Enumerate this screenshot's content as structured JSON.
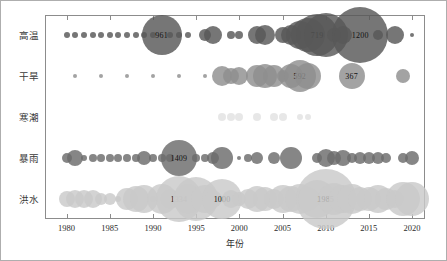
{
  "chart_data": {
    "type": "scatter",
    "title": "",
    "xlabel": "年份",
    "ylabel": "",
    "xlim": [
      1977.5,
      2021.5
    ],
    "xticks": [
      1980,
      1985,
      1990,
      1995,
      2000,
      2005,
      2010,
      2015,
      2020
    ],
    "xticklabels": [
      "1980",
      "1985",
      "1990",
      "1995",
      "2000",
      "2005",
      "2010",
      "2015",
      "2020"
    ],
    "grid": false,
    "legend": "none",
    "categories": [
      "高温",
      "干旱",
      "寒潮",
      "暴雨",
      "洪水"
    ],
    "series": [
      {
        "name": "高温",
        "color": "#585858",
        "points": [
          {
            "x": 1980,
            "size": 3
          },
          {
            "x": 1981,
            "size": 3
          },
          {
            "x": 1982,
            "size": 3
          },
          {
            "x": 1983,
            "size": 3
          },
          {
            "x": 1984,
            "size": 3
          },
          {
            "x": 1985,
            "size": 3
          },
          {
            "x": 1986,
            "size": 3
          },
          {
            "x": 1987,
            "size": 3
          },
          {
            "x": 1988,
            "size": 3
          },
          {
            "x": 1989,
            "size": 3
          },
          {
            "x": 1990,
            "size": 3
          },
          {
            "x": 1991,
            "size": 20,
            "label": "961"
          },
          {
            "x": 1992,
            "size": 3
          },
          {
            "x": 1993,
            "size": 3
          },
          {
            "x": 1994,
            "size": 3
          },
          {
            "x": 1996,
            "size": 6
          },
          {
            "x": 1997,
            "size": 9
          },
          {
            "x": 1999,
            "size": 4
          },
          {
            "x": 2000,
            "size": 4
          },
          {
            "x": 2002,
            "size": 9
          },
          {
            "x": 2003,
            "size": 10
          },
          {
            "x": 2005,
            "size": 8
          },
          {
            "x": 2006,
            "size": 10
          },
          {
            "x": 2007,
            "size": 14
          },
          {
            "x": 2008,
            "size": 17
          },
          {
            "x": 2009,
            "size": 21,
            "label": "719"
          },
          {
            "x": 2010,
            "size": 22
          },
          {
            "x": 2011,
            "size": 7
          },
          {
            "x": 2012,
            "size": 9
          },
          {
            "x": 2014,
            "size": 28,
            "label": "1200"
          },
          {
            "x": 2016,
            "size": 5
          },
          {
            "x": 2018,
            "size": 9
          },
          {
            "x": 2020,
            "size": 2
          }
        ]
      },
      {
        "name": "干旱",
        "color": "#8f8f8f",
        "points": [
          {
            "x": 1981,
            "size": 2
          },
          {
            "x": 1984,
            "size": 2
          },
          {
            "x": 1987,
            "size": 2
          },
          {
            "x": 1990,
            "size": 2
          },
          {
            "x": 1993,
            "size": 2
          },
          {
            "x": 1996,
            "size": 2
          },
          {
            "x": 1998,
            "size": 10
          },
          {
            "x": 1999,
            "size": 8
          },
          {
            "x": 2000,
            "size": 9
          },
          {
            "x": 2002,
            "size": 11
          },
          {
            "x": 2003,
            "size": 12
          },
          {
            "x": 2004,
            "size": 11
          },
          {
            "x": 2005,
            "size": 6
          },
          {
            "x": 2006,
            "size": 12
          },
          {
            "x": 2007,
            "size": 16,
            "label": "592"
          },
          {
            "x": 2008,
            "size": 13
          },
          {
            "x": 2013,
            "size": 13,
            "label": "367"
          },
          {
            "x": 2019,
            "size": 7
          }
        ]
      },
      {
        "name": "寒潮",
        "color": "#e2e2e2",
        "points": [
          {
            "x": 1998,
            "size": 4
          },
          {
            "x": 1999,
            "size": 4
          },
          {
            "x": 2000,
            "size": 4
          },
          {
            "x": 2002,
            "size": 4
          },
          {
            "x": 2004,
            "size": 4
          },
          {
            "x": 2005,
            "size": 4
          },
          {
            "x": 2007,
            "size": 3
          },
          {
            "x": 2008,
            "size": 3
          }
        ]
      },
      {
        "name": "暴雨",
        "color": "#6b6b6b",
        "points": [
          {
            "x": 1980,
            "size": 5
          },
          {
            "x": 1981,
            "size": 8
          },
          {
            "x": 1982,
            "size": 3
          },
          {
            "x": 1983,
            "size": 4
          },
          {
            "x": 1984,
            "size": 4
          },
          {
            "x": 1985,
            "size": 4
          },
          {
            "x": 1986,
            "size": 4
          },
          {
            "x": 1987,
            "size": 4
          },
          {
            "x": 1988,
            "size": 4
          },
          {
            "x": 1989,
            "size": 7
          },
          {
            "x": 1990,
            "size": 4
          },
          {
            "x": 1991,
            "size": 4
          },
          {
            "x": 1992,
            "size": 4
          },
          {
            "x": 1993,
            "size": 18,
            "label": "1409"
          },
          {
            "x": 1995,
            "size": 4
          },
          {
            "x": 1996,
            "size": 4
          },
          {
            "x": 1997,
            "size": 6
          },
          {
            "x": 1998,
            "size": 11
          },
          {
            "x": 2000,
            "size": 2
          },
          {
            "x": 2001,
            "size": 4
          },
          {
            "x": 2002,
            "size": 6
          },
          {
            "x": 2004,
            "size": 6
          },
          {
            "x": 2006,
            "size": 11
          },
          {
            "x": 2009,
            "size": 5
          },
          {
            "x": 2010,
            "size": 9
          },
          {
            "x": 2011,
            "size": 7
          },
          {
            "x": 2012,
            "size": 8
          },
          {
            "x": 2013,
            "size": 5
          },
          {
            "x": 2014,
            "size": 6
          },
          {
            "x": 2015,
            "size": 6
          },
          {
            "x": 2016,
            "size": 6
          },
          {
            "x": 2017,
            "size": 5
          },
          {
            "x": 2019,
            "size": 5
          },
          {
            "x": 2020,
            "size": 7
          }
        ]
      },
      {
        "name": "洪水",
        "color": "#c9c9c9",
        "points": [
          {
            "x": 1980,
            "size": 8
          },
          {
            "x": 1981,
            "size": 9
          },
          {
            "x": 1982,
            "size": 9
          },
          {
            "x": 1983,
            "size": 9
          },
          {
            "x": 1984,
            "size": 6
          },
          {
            "x": 1985,
            "size": 6
          },
          {
            "x": 1986,
            "size": 3
          },
          {
            "x": 1987,
            "size": 11
          },
          {
            "x": 1988,
            "size": 13
          },
          {
            "x": 1989,
            "size": 14
          },
          {
            "x": 1990,
            "size": 3
          },
          {
            "x": 1991,
            "size": 15
          },
          {
            "x": 1992,
            "size": 10
          },
          {
            "x": 1993,
            "size": 23,
            "label": "1334"
          },
          {
            "x": 1994,
            "size": 15
          },
          {
            "x": 1995,
            "size": 22
          },
          {
            "x": 1996,
            "size": 14
          },
          {
            "x": 1997,
            "size": 9
          },
          {
            "x": 1998,
            "size": 20,
            "label": "1000"
          },
          {
            "x": 1999,
            "size": 9
          },
          {
            "x": 2000,
            "size": 7
          },
          {
            "x": 2001,
            "size": 10
          },
          {
            "x": 2002,
            "size": 13
          },
          {
            "x": 2003,
            "size": 12
          },
          {
            "x": 2004,
            "size": 10
          },
          {
            "x": 2005,
            "size": 14
          },
          {
            "x": 2006,
            "size": 13
          },
          {
            "x": 2007,
            "size": 15
          },
          {
            "x": 2008,
            "size": 12
          },
          {
            "x": 2009,
            "size": 19
          },
          {
            "x": 2010,
            "size": 30,
            "label": "1985"
          },
          {
            "x": 2011,
            "size": 16
          },
          {
            "x": 2012,
            "size": 14
          },
          {
            "x": 2013,
            "size": 15
          },
          {
            "x": 2014,
            "size": 12
          },
          {
            "x": 2015,
            "size": 12
          },
          {
            "x": 2016,
            "size": 14
          },
          {
            "x": 2017,
            "size": 11
          },
          {
            "x": 2018,
            "size": 9
          },
          {
            "x": 2019,
            "size": 17
          },
          {
            "x": 2020,
            "size": 17
          }
        ]
      }
    ]
  }
}
